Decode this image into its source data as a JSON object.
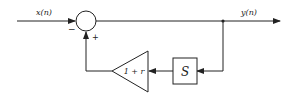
{
  "diagram": {
    "type": "block-diagram",
    "input_label": "x(n)",
    "output_label": "y(n)",
    "summing_junction": {
      "minus_sign": "−",
      "plus_sign": "+"
    },
    "delay_block": {
      "label": "S"
    },
    "gain_block": {
      "label": "1 + r"
    },
    "colors": {
      "line": "#222222",
      "background": "#ffffff"
    }
  }
}
